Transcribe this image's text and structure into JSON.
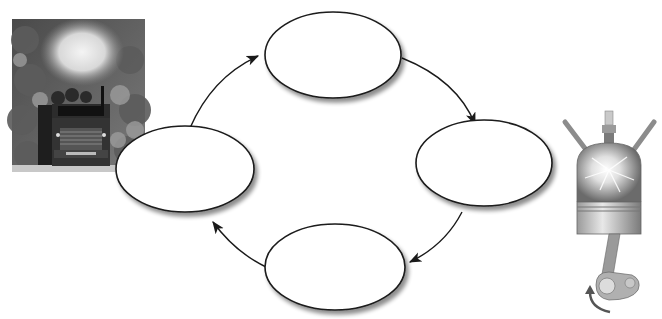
{
  "diagram": {
    "type": "cycle",
    "nodes": [
      {
        "id": "top",
        "label": "",
        "cx": 333,
        "cy": 55,
        "rx": 68,
        "ry": 43
      },
      {
        "id": "right",
        "label": "",
        "cx": 484,
        "cy": 163,
        "rx": 68,
        "ry": 43
      },
      {
        "id": "bottom",
        "label": "",
        "cx": 335,
        "cy": 267,
        "rx": 70,
        "ry": 43
      },
      {
        "id": "left",
        "label": "",
        "cx": 185,
        "cy": 169,
        "rx": 69,
        "ry": 43
      }
    ],
    "edges": [
      {
        "from": "left",
        "to": "top"
      },
      {
        "from": "top",
        "to": "right"
      },
      {
        "from": "right",
        "to": "bottom"
      },
      {
        "from": "bottom",
        "to": "left"
      }
    ],
    "colors": {
      "stroke": "#1a1a1a",
      "fill": "#ffffff",
      "shadow": "#9a9a9a"
    }
  },
  "images": {
    "left": {
      "subject": "logging truck with exhaust smoke",
      "style": "grayscale photo"
    },
    "right": {
      "subject": "engine cylinder with piston, spark plug and crankshaft",
      "style": "illustration"
    }
  }
}
